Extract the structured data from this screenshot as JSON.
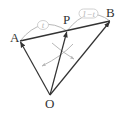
{
  "diagram": {
    "points": {
      "A": {
        "label": "A",
        "x": 20,
        "y": 41
      },
      "P": {
        "label": "P",
        "x": 67,
        "y": 31
      },
      "B": {
        "label": "B",
        "x": 110,
        "y": 21
      },
      "O": {
        "label": "O",
        "x": 50,
        "y": 95
      }
    },
    "ratio_labels": {
      "AP": "t",
      "PB": "1−t"
    },
    "colors": {
      "line": "#333333",
      "annotation": "#b8b8b8"
    },
    "vectors": [
      "OA",
      "OP",
      "OB"
    ],
    "segment": "AB"
  }
}
